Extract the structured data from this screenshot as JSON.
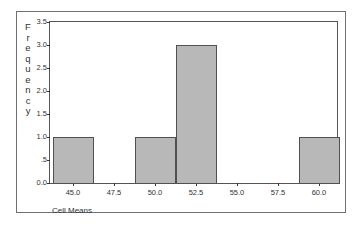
{
  "chart_data": {
    "type": "bar",
    "title": "",
    "xlabel": "Cell Means",
    "ylabel": "Frequency",
    "categories": [
      "45.0",
      "47.5",
      "50.0",
      "52.5",
      "55.0",
      "57.5",
      "60.0"
    ],
    "values": [
      1,
      0,
      1,
      3,
      0,
      0,
      1
    ],
    "ylim": [
      0,
      3.5
    ],
    "yticks": [
      "0.0",
      ".5",
      "1.0",
      "1.5",
      "2.0",
      "2.5",
      "3.0",
      "3.5"
    ],
    "grid": false,
    "legend": "none"
  },
  "labels": {
    "ylabel_letters": [
      "F",
      "r",
      "e",
      "q",
      "u",
      "e",
      "n",
      "c",
      "y"
    ],
    "xlabel": "Cell Means"
  },
  "colors": {
    "bar_fill": "#b8b8b8",
    "bar_border": "#505050",
    "axis": "#555555"
  }
}
